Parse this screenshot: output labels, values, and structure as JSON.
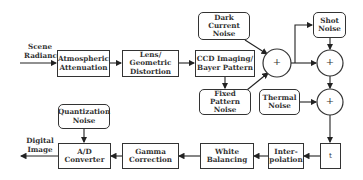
{
  "diagram": {
    "input_label": "Scene\nRadiance",
    "output_label": "Digital\nImage",
    "blocks": {
      "atmospheric": "Atmospheric\nAttenuation",
      "lens": "Lens/ Geometric\nDistortion",
      "ccd": "CCD Imaging/\nBayer Pattern",
      "interpolation": "Inter-\npolation",
      "white_balancing": "White\nBalancing",
      "gamma": "Gamma\nCorrection",
      "ad_converter": "A/D\nConverter",
      "t_block": "t"
    },
    "noise_sources": {
      "dark_current": "Dark Current\nNoise",
      "shot": "Shot\nNoise",
      "fixed_pattern": "Fixed Pattern\nNoise",
      "thermal": "Thermal\nNoise",
      "quantization": "Quantization\nNoise"
    },
    "summing_symbol": "+",
    "colors": {
      "stroke": "#333333",
      "fill": "#ffffff"
    }
  }
}
